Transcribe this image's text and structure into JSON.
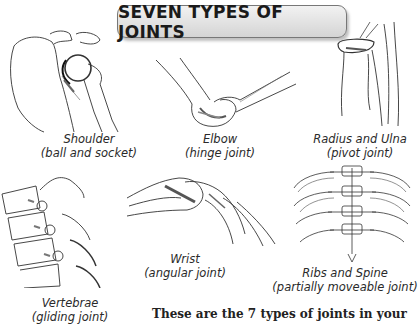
{
  "title": "SEVEN TYPES OF JOINTS",
  "joints": [
    {
      "name": "Shoulder",
      "type": "(ball and socket)"
    },
    {
      "name": "Elbow",
      "type": "(hinge joint)"
    },
    {
      "name": "Radius and Ulna",
      "type": "(pivot joint)"
    },
    {
      "name": "Vertebrae",
      "type": "(gliding joint)"
    },
    {
      "name": "Wrist",
      "type": "(angular joint)"
    },
    {
      "name": "Ribs and Spine",
      "type": "(partially moveable joint)"
    }
  ],
  "body_text": "These are the 7 types of joints in your",
  "colors": {
    "banner_fill": "#e0e0e0",
    "banner_border": "#777777",
    "ink": "#222222"
  }
}
